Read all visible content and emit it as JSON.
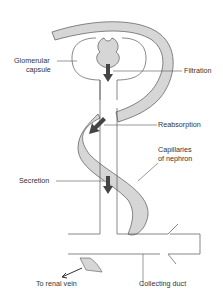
{
  "diagram": {
    "type": "nephron-processes",
    "labels": {
      "glomerular_capsule_1": "Glomerular",
      "glomerular_capsule_2": "capsule",
      "filtration": "Filtration",
      "reabsorption": "Reabsorption",
      "capillaries_1": "Capillaries",
      "capillaries_2": "of nephron",
      "secretion": "Secretion",
      "to_renal_vein": "To renal vein",
      "collecting_duct": "Collecting duct"
    },
    "colors": {
      "capillary_fill": "#d6d6d6",
      "line": "#555555",
      "arrow": "#444444"
    }
  }
}
